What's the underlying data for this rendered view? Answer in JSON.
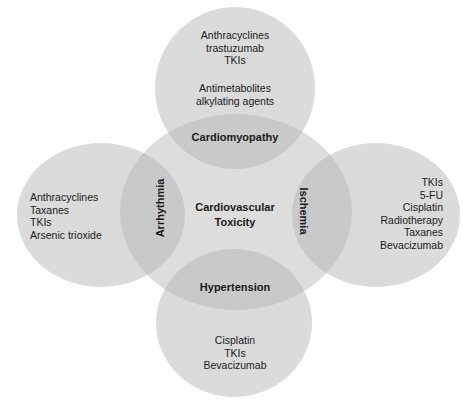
{
  "diagram": {
    "center": {
      "line1": "Cardiovascular",
      "line2": "Toxicity"
    },
    "nodes": {
      "top": {
        "label": "Cardiomyopathy",
        "agents": [
          "Anthracyclines",
          "trastuzumab",
          "TKIs"
        ],
        "agents2": [
          "Antimetabolites",
          "alkylating agents"
        ]
      },
      "left": {
        "label": "Arrhythmia",
        "agents": [
          "Anthracyclines",
          "Taxanes",
          "TKIs",
          "Arsenic trioxide"
        ]
      },
      "right": {
        "label": "Ischemia",
        "agents": [
          "TKIs",
          "5-FU",
          "Cisplatin",
          "Radiotherapy",
          "Taxanes",
          "Bevacizumab"
        ]
      },
      "bottom": {
        "label": "Hypertension",
        "agents": [
          "Cisplatin",
          "TKIs",
          "Bevacizumab"
        ]
      }
    },
    "colors": {
      "outer_fill": "#d8d8d8",
      "center_fill": "#c8c8c8",
      "text": "#1a1a1a",
      "background": "#ffffff"
    }
  }
}
